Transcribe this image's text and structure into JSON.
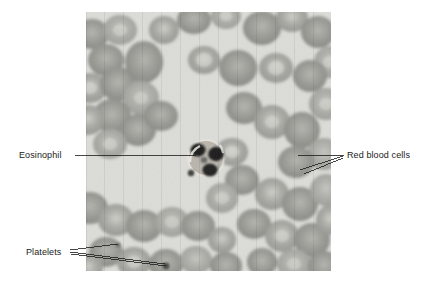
{
  "figure": {
    "type": "photomicrograph",
    "plate": {
      "x": 86,
      "y": 12,
      "width": 245,
      "height": 259,
      "background_color": "#d9d9d6",
      "description": "Light-microscope view of a stained peripheral blood smear showing numerous red blood cells, one eosinophil, and small platelets."
    },
    "background_color": "#ffffff"
  },
  "annotations": [
    {
      "id": "eosinophil",
      "label": "Eosinophil",
      "text_x": 19,
      "text_y": 150,
      "leader_lines": [
        {
          "x1": 75,
          "y1": 155,
          "x2": 196,
          "y2": 155
        }
      ],
      "target": {
        "x": 200,
        "y": 157
      },
      "color": "#1a1a1a"
    },
    {
      "id": "red-blood-cells",
      "label": "Red blood cells",
      "text_x": 347,
      "text_y": 150,
      "leader_lines": [
        {
          "x1": 298,
          "y1": 155,
          "x2": 344,
          "y2": 155
        },
        {
          "x1": 300,
          "y1": 170,
          "x2": 344,
          "y2": 156
        },
        {
          "x1": 303,
          "y1": 173,
          "x2": 344,
          "y2": 158
        }
      ],
      "target": {
        "x": 300,
        "y": 165
      },
      "color": "#1a1a1a"
    },
    {
      "id": "platelets",
      "label": "Platelets",
      "text_x": 26,
      "text_y": 247,
      "leader_lines": [
        {
          "x1": 70,
          "y1": 251,
          "x2": 117,
          "y2": 245
        },
        {
          "x1": 70,
          "y1": 252,
          "x2": 165,
          "y2": 264
        },
        {
          "x1": 71,
          "y1": 254,
          "x2": 166,
          "y2": 266
        }
      ],
      "target": {
        "x": 165,
        "y": 265
      },
      "color": "#1a1a1a"
    }
  ],
  "cells": {
    "eosinophil": {
      "name": "Eosinophil",
      "center_x": 206,
      "center_y": 158,
      "radius": 17,
      "cytoplasm_color": "#b0aca4",
      "nucleus_color": "#1c1c1c",
      "lobes": 3
    },
    "platelets": [
      {
        "x": 191,
        "y": 172,
        "r": 3
      },
      {
        "x": 166,
        "y": 265,
        "r": 3
      },
      {
        "x": 118,
        "y": 244,
        "r": 2
      }
    ],
    "red_blood_cell_color": "#a8a8a4",
    "red_blood_cell_center_color": "#c9c9c4",
    "plasma_color": "#dededa"
  },
  "typography": {
    "font_size_px": 9,
    "text_color": "#1a1a1a"
  }
}
